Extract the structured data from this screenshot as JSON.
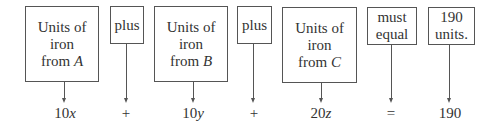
{
  "boxes": [
    {
      "id": "box-a",
      "lines": [
        "Units of",
        "iron",
        "from "
      ],
      "italic": "A"
    },
    {
      "id": "plus-1",
      "lines": [
        "plus"
      ]
    },
    {
      "id": "box-b",
      "lines": [
        "Units of",
        "iron",
        "from "
      ],
      "italic": "B"
    },
    {
      "id": "plus-2",
      "lines": [
        "plus"
      ]
    },
    {
      "id": "box-c",
      "lines": [
        "Units of",
        "iron",
        "from "
      ],
      "italic": "C"
    },
    {
      "id": "must-equal",
      "lines": [
        "must",
        "equal"
      ]
    },
    {
      "id": "total",
      "lines": [
        "190",
        "units."
      ]
    }
  ],
  "expression": {
    "term_a": {
      "coef": "10",
      "var": "x"
    },
    "op1": "+",
    "term_b": {
      "coef": "10",
      "var": "y"
    },
    "op2": "+",
    "term_c": {
      "coef": "20",
      "var": "z"
    },
    "eq": "=",
    "total": "190"
  }
}
